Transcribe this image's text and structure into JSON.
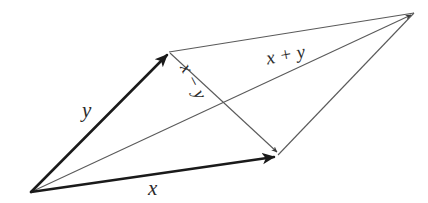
{
  "figure": {
    "kind": "vector-parallelogram-diagram",
    "background_color": "#ffffff",
    "bold_stroke_color": "#1a1a1a",
    "thin_stroke_color": "#5a5a5a",
    "label_color": "#2b2b2b",
    "width": 428,
    "height": 203
  },
  "labels": {
    "y": "y",
    "x": "x",
    "x_plus_y": "x + y",
    "x_minus_y": "x − y"
  },
  "geometry": {
    "origin": {
      "x": 31,
      "y": 192
    },
    "tip_y": {
      "x": 169,
      "y": 52
    },
    "tip_x": {
      "x": 278,
      "y": 155
    },
    "tip_sum": {
      "x": 414,
      "y": 13
    },
    "vectors": [
      {
        "name": "y",
        "from": "origin",
        "to": "tip_y",
        "weight": "bold",
        "arrow": true
      },
      {
        "name": "x",
        "from": "origin",
        "to": "tip_x",
        "weight": "bold",
        "arrow": true
      },
      {
        "name": "x + y",
        "from": "origin",
        "to": "tip_sum",
        "weight": "thin",
        "arrow": true
      },
      {
        "name": "x − y",
        "from": "tip_y",
        "to": "tip_x",
        "weight": "thin",
        "arrow": true
      }
    ],
    "edges": [
      {
        "name": "top-edge",
        "from": "tip_y",
        "to": "tip_sum",
        "weight": "thin"
      },
      {
        "name": "right-edge",
        "from": "tip_x",
        "to": "tip_sum",
        "weight": "thin"
      }
    ]
  }
}
